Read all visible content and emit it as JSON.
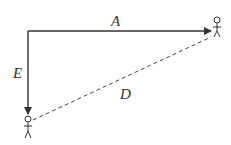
{
  "diagram": {
    "labels": {
      "A": "A",
      "E": "E",
      "D": "D"
    },
    "edges": [
      {
        "name": "A",
        "from": "corner",
        "to": "person-right",
        "style": "solid-arrow"
      },
      {
        "name": "E",
        "from": "corner",
        "to": "person-left",
        "style": "solid-arrow"
      },
      {
        "name": "D",
        "from": "person-left",
        "to": "person-right",
        "style": "dashed"
      }
    ],
    "nodes": [
      "person-left",
      "person-right"
    ],
    "colors": {
      "line": "#333333",
      "background": "#ffffff"
    }
  }
}
